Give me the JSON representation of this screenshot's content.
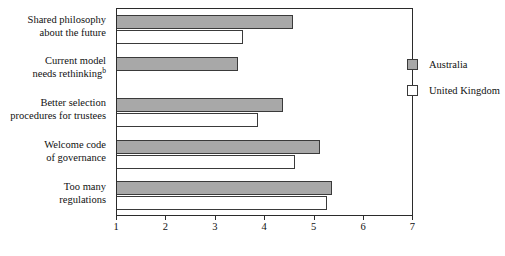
{
  "chart_data": {
    "type": "bar",
    "orientation": "horizontal",
    "title": "",
    "xlabel": "",
    "ylabel": "",
    "xlim": [
      1,
      7
    ],
    "xticks": [
      1,
      2,
      3,
      4,
      5,
      6,
      7
    ],
    "grid": false,
    "legend_position": "inside-right-top",
    "categories": [
      "Shared philosophy about the future",
      "Current model needs rethinking",
      "Better selection procedures for trustees",
      "Welcome code of governance",
      "Too many regulations"
    ],
    "category_lines": [
      [
        "Shared philosophy",
        "about the future"
      ],
      [
        "Current model",
        "needs rethinking"
      ],
      [
        "Better selection",
        "procedures for trustees"
      ],
      [
        "Welcome code",
        "of governance"
      ],
      [
        "Too many",
        "regulations"
      ]
    ],
    "category_footnotes": [
      "",
      "b",
      "",
      "",
      ""
    ],
    "series": [
      {
        "name": "Australia",
        "color": "#a8a8a8",
        "values": [
          4.55,
          3.45,
          4.35,
          5.1,
          5.35
        ]
      },
      {
        "name": "United Kingdom",
        "color": "#ffffff",
        "values": [
          3.55,
          null,
          3.85,
          4.6,
          5.25
        ]
      }
    ]
  },
  "legend": {
    "items": [
      {
        "label": "Australia",
        "swatch": "filled-gray-swatch"
      },
      {
        "label": "United Kingdom",
        "swatch": "open-white-swatch"
      }
    ]
  },
  "axis": {
    "tick_labels": [
      "1",
      "2",
      "3",
      "4",
      "5",
      "6",
      "7"
    ]
  },
  "colors": {
    "australia_fill": "#a8a8a8",
    "uk_fill": "#ffffff",
    "bar_outline": "#3a3a3a",
    "axis": "#2b2b2b",
    "text": "#111111",
    "background": "#ffffff"
  }
}
